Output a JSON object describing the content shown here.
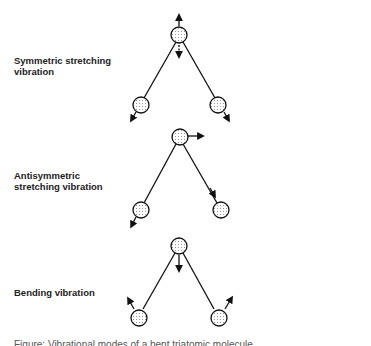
{
  "diagram": {
    "title": "Vibrational modes of a bent triatomic molecule",
    "modes": [
      {
        "label_line1": "Symmetric stretching",
        "label_line2": "vibration"
      },
      {
        "label_line1": "Antisymmetric",
        "label_line2": "stretching vibration"
      },
      {
        "label_line1": "Bending vibration",
        "label_line2": ""
      }
    ],
    "caption": "Figure: Vibrational modes of a bent triatomic molecule"
  }
}
